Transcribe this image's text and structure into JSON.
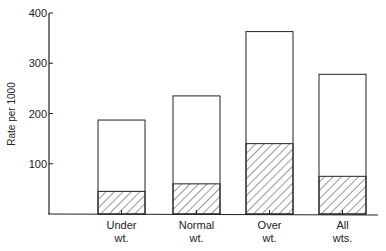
{
  "chart_data": {
    "type": "bar",
    "subtype": "stacked-overlay",
    "title": "",
    "xlabel": "",
    "ylabel": "Rate per 1000",
    "ylim": [
      0,
      400
    ],
    "yticks": [
      100,
      200,
      300,
      400
    ],
    "grid": false,
    "legend": null,
    "categories": [
      {
        "line1": "Under",
        "line2": "wt."
      },
      {
        "line1": "Normal",
        "line2": "wt."
      },
      {
        "line1": "Over",
        "line2": "wt."
      },
      {
        "line1": "All",
        "line2": "wts."
      }
    ],
    "series": [
      {
        "name": "total",
        "style": "open",
        "values": [
          187,
          235,
          363,
          278
        ]
      },
      {
        "name": "hatched portion",
        "style": "hatched",
        "values": [
          45,
          60,
          140,
          75
        ]
      }
    ]
  }
}
